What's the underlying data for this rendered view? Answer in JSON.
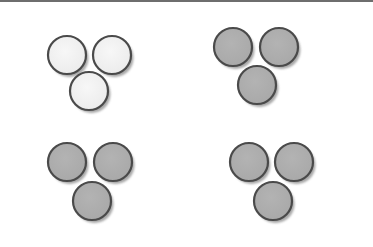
{
  "figure": {
    "width": 373,
    "height": 247,
    "background": "#ffffff",
    "top_border_color": "#6e6e6e"
  },
  "colors": {
    "light_fill": "#ececec",
    "light_fill_center": "#f7f7f7",
    "dark_fill": "#a9a9a9",
    "dark_fill_center": "#b3b3b3",
    "stroke": "#4a4a4a",
    "shadow": "#8a8a8a"
  },
  "groups": [
    {
      "id": "group-top-left",
      "fill": "light",
      "circles": [
        {
          "cx": 67,
          "cy": 55,
          "r": 19
        },
        {
          "cx": 112,
          "cy": 55,
          "r": 19
        },
        {
          "cx": 89,
          "cy": 91,
          "r": 19
        }
      ]
    },
    {
      "id": "group-top-right",
      "fill": "dark",
      "circles": [
        {
          "cx": 233,
          "cy": 47,
          "r": 19
        },
        {
          "cx": 279,
          "cy": 47,
          "r": 19
        },
        {
          "cx": 257,
          "cy": 85,
          "r": 19
        }
      ]
    },
    {
      "id": "group-bottom-left",
      "fill": "dark",
      "circles": [
        {
          "cx": 67,
          "cy": 162,
          "r": 19
        },
        {
          "cx": 113,
          "cy": 162,
          "r": 19
        },
        {
          "cx": 92,
          "cy": 201,
          "r": 19
        }
      ]
    },
    {
      "id": "group-bottom-right",
      "fill": "dark",
      "circles": [
        {
          "cx": 249,
          "cy": 162,
          "r": 19
        },
        {
          "cx": 294,
          "cy": 162,
          "r": 19
        },
        {
          "cx": 273,
          "cy": 201,
          "r": 19
        }
      ]
    }
  ]
}
